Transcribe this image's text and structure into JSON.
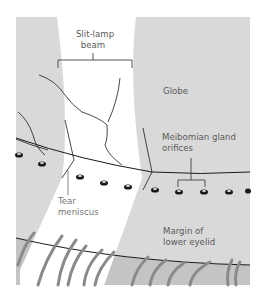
{
  "diagram": {
    "labels": {
      "beam_line1": "Slit-lamp",
      "beam_line2": "beam",
      "globe": "Globe",
      "orifices_line1": "Meibomian gland",
      "orifices_line2": "orifices",
      "tear_line1": "Tear",
      "tear_line2": "meniscus",
      "margin_line1": "Margin of",
      "margin_line2": "lower eyelid"
    },
    "colors": {
      "background": "#ffffff",
      "globe_gray": "#d9d9d9",
      "lid_gray": "#c4c4c4",
      "beam_white": "#ffffff",
      "line_black": "#1a1a1a",
      "lash_gray": "#8a8a8a",
      "label_text": "#5a5a5a"
    }
  }
}
